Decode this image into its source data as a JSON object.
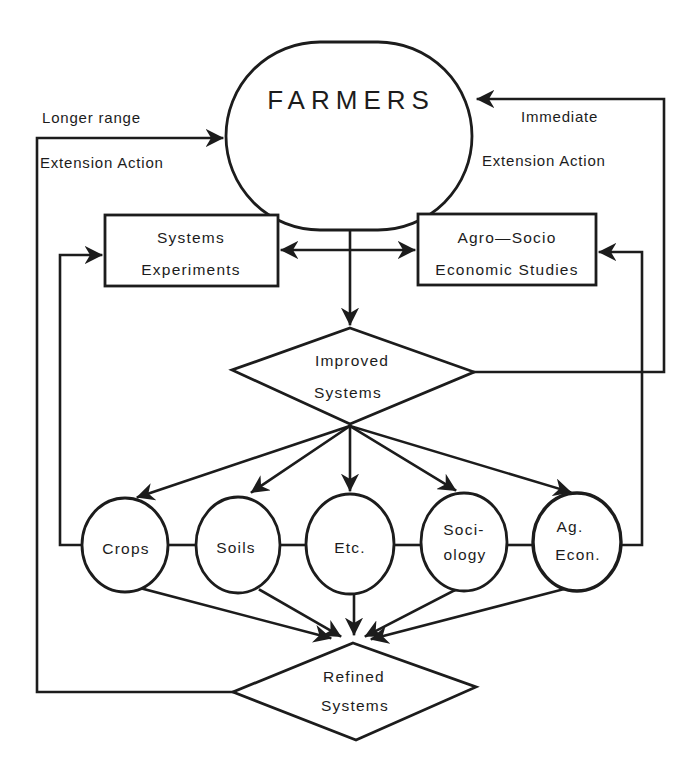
{
  "diagram": {
    "farmers": {
      "label": "FARMERS"
    },
    "left_feedback": {
      "line1": "Longer range",
      "line2": "Extension Action"
    },
    "right_feedback": {
      "line1": "Immediate",
      "line2": "Extension Action"
    },
    "systems_experiments": {
      "line1": "Systems",
      "line2": "Experiments"
    },
    "agro_socio": {
      "line1": "Agro—Socio",
      "line2": "Economic Studies"
    },
    "improved_systems": {
      "line1": "Improved",
      "line2": "Systems"
    },
    "disciplines": [
      {
        "line1": "Crops",
        "line2": ""
      },
      {
        "line1": "Soils",
        "line2": ""
      },
      {
        "line1": "Etc.",
        "line2": ""
      },
      {
        "line1": "Soci-",
        "line2": "ology"
      },
      {
        "line1": "Ag.",
        "line2": "Econ."
      }
    ],
    "refined_systems": {
      "line1": "Refined",
      "line2": "Systems"
    },
    "colors": {
      "ink": "#1c1c1c",
      "background": "#ffffff"
    }
  }
}
